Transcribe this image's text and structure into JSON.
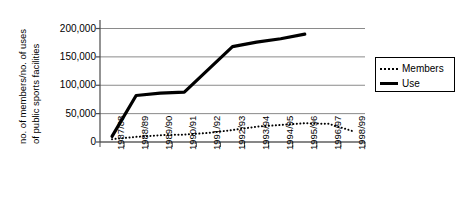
{
  "chart_data": {
    "type": "line",
    "title": "",
    "xlabel": "",
    "ylabel": "no. of members/no. of uses of public sports facilities",
    "ylabel_line1": "no. of members/no. of uses",
    "ylabel_line2": "of public sports facilities",
    "categories": [
      "1987/88",
      "1988/89",
      "1989/90",
      "1990/91",
      "1991/92",
      "1992/93",
      "1993/94",
      "1994/95",
      "1995/96",
      "1996/97",
      "1998/99"
    ],
    "ytick_labels": [
      "200,000",
      "150,000",
      "100,000",
      "50,000",
      "0"
    ],
    "ytick_values": [
      200000,
      150000,
      100000,
      50000,
      0
    ],
    "ylim": [
      0,
      215000
    ],
    "grid": true,
    "legend_position": "right",
    "series": [
      {
        "name": "Members",
        "style": "dotted",
        "color": "#000000",
        "values": [
          5000,
          9000,
          12000,
          13000,
          16000,
          21000,
          27000,
          30000,
          33000,
          32000,
          19000
        ]
      },
      {
        "name": "Use",
        "style": "solid",
        "color": "#000000",
        "values": [
          10000,
          82000,
          86000,
          88000,
          128000,
          168000,
          176000,
          182000,
          190000,
          null,
          null
        ]
      }
    ]
  },
  "legend": {
    "entries": [
      {
        "label": "Members"
      },
      {
        "label": "Use"
      }
    ]
  }
}
